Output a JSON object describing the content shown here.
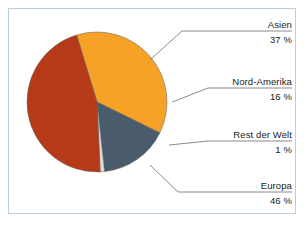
{
  "chart_data": {
    "type": "pie",
    "title": "",
    "categories": [
      "Asien",
      "Nord-Amerika",
      "Rest der Welt",
      "Europa"
    ],
    "values": [
      37,
      16,
      1,
      46
    ],
    "value_suffix": "%",
    "value_labels": [
      "37 %",
      "16 %",
      "1 %",
      "46 %"
    ],
    "colors": [
      "#f5a227",
      "#4a5c6b",
      "#dcdcd4",
      "#b63a18"
    ],
    "legend": "labels-outside-with-leader-lines",
    "grid": false
  },
  "figure": {
    "border_color": "#b9cfdd",
    "background": "#ffffff"
  },
  "labels": [
    {
      "name": "Asien",
      "value": "37 %"
    },
    {
      "name": "Nord-Amerika",
      "value": "16 %"
    },
    {
      "name": "Rest der Welt",
      "value": "1 %"
    },
    {
      "name": "Europa",
      "value": "46 %"
    }
  ]
}
